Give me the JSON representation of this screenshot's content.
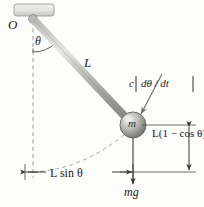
{
  "figure": {
    "labels": {
      "pivot": "O",
      "angle": "θ",
      "rod_length": "L",
      "mass": "m",
      "damping_coeff": "c",
      "damping_rate": "dθ / dt",
      "vertical_rise": "L(1 − cos θ)",
      "horizontal_offset": "L sin θ",
      "weight": "mg"
    },
    "colors": {
      "background": "#fdfdfc",
      "ink": "#1a1a1a",
      "rod_light": "#d8d8d4",
      "rod_dark": "#8d8d88",
      "bob_light": "#e2e2e0",
      "bob_dark": "#767672",
      "support_fill": "#e8e8e6",
      "dashed": "#9a9a96",
      "dimension": "#3a3a3a"
    },
    "geometry": {
      "pivot_x": 33,
      "pivot_y": 19,
      "bob_x": 133,
      "bob_y": 125,
      "bob_radius": 13,
      "baseline_y": 172,
      "angle_degrees": 43
    }
  }
}
